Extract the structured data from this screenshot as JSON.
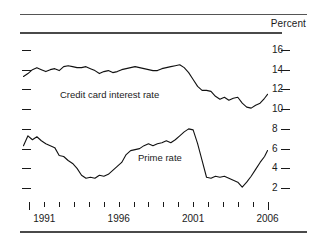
{
  "figure": {
    "unit_label": "Percent"
  },
  "chart_data": {
    "type": "line",
    "title": "",
    "subtitle": "",
    "xlabel": "",
    "ylabel": "Percent",
    "unit_label": "Percent",
    "grid": false,
    "legend": "inline-annotations",
    "xlim": [
      1989.5,
      2006.3
    ],
    "ylim": [
      1.0,
      17.0
    ],
    "yticks": [
      16,
      14,
      12,
      10,
      8,
      6,
      4,
      2
    ],
    "ytick_labels": [
      "16",
      "14",
      "12",
      "10",
      "8",
      "6",
      "4",
      "2"
    ],
    "xticks": [
      1990,
      1991,
      1992,
      1993,
      1994,
      1995,
      1996,
      1997,
      1998,
      1999,
      2000,
      2001,
      2002,
      2003,
      2004,
      2005,
      2006
    ],
    "xtick_labels": [
      "1991",
      "1996",
      "2001",
      "2006"
    ],
    "xtick_labeled_years": [
      1991,
      1996,
      2001,
      2006
    ],
    "series": [
      {
        "name": "Credit card interest rate",
        "label": "Credit card interest rate",
        "color": "#111111",
        "x": [
          1989.6,
          1989.9,
          1990.2,
          1990.5,
          1990.8,
          1991.1,
          1991.4,
          1991.7,
          1992.0,
          1992.3,
          1992.6,
          1992.9,
          1993.2,
          1993.5,
          1993.8,
          1994.1,
          1994.4,
          1994.7,
          1995.0,
          1995.3,
          1995.6,
          1995.9,
          1996.2,
          1996.5,
          1996.8,
          1997.1,
          1997.4,
          1997.7,
          1998.0,
          1998.3,
          1998.6,
          1998.9,
          1999.2,
          1999.5,
          1999.8,
          2000.1,
          2000.4,
          2000.7,
          2001.0,
          2001.3,
          2001.6,
          2001.9,
          2002.2,
          2002.5,
          2002.8,
          2003.1,
          2003.4,
          2003.7,
          2004.0,
          2004.3,
          2004.6,
          2004.9,
          2005.2,
          2005.5,
          2005.8,
          2006.0
        ],
        "values": [
          13.3,
          13.6,
          14.0,
          14.2,
          14.0,
          13.8,
          14.0,
          14.1,
          13.9,
          14.3,
          14.4,
          14.3,
          14.2,
          14.2,
          14.3,
          14.1,
          13.9,
          13.6,
          13.8,
          13.9,
          13.7,
          13.8,
          14.0,
          14.1,
          14.2,
          14.3,
          14.2,
          14.1,
          14.0,
          13.9,
          13.9,
          14.1,
          14.2,
          14.3,
          14.4,
          14.5,
          14.2,
          13.7,
          13.0,
          12.3,
          11.9,
          11.9,
          11.8,
          11.3,
          11.0,
          11.2,
          10.9,
          11.1,
          11.2,
          10.6,
          10.2,
          10.1,
          10.4,
          10.6,
          11.1,
          11.5
        ]
      },
      {
        "name": "Prime rate",
        "label": "Prime rate",
        "color": "#111111",
        "x": [
          1989.6,
          1989.9,
          1990.2,
          1990.5,
          1990.8,
          1991.1,
          1991.4,
          1991.7,
          1992.0,
          1992.3,
          1992.6,
          1992.9,
          1993.2,
          1993.5,
          1993.8,
          1994.1,
          1994.4,
          1994.7,
          1995.0,
          1995.3,
          1995.6,
          1995.9,
          1996.2,
          1996.5,
          1996.8,
          1997.1,
          1997.4,
          1997.7,
          1998.0,
          1998.3,
          1998.6,
          1998.9,
          1999.2,
          1999.5,
          1999.8,
          2000.1,
          2000.4,
          2000.7,
          2001.0,
          2001.3,
          2001.6,
          2001.9,
          2002.2,
          2002.5,
          2002.8,
          2003.1,
          2003.4,
          2003.7,
          2004.0,
          2004.3,
          2004.6,
          2004.9,
          2005.2,
          2005.5,
          2005.8,
          2006.0
        ],
        "values": [
          6.3,
          7.3,
          6.9,
          7.2,
          6.8,
          6.5,
          6.3,
          6.1,
          5.3,
          5.2,
          4.8,
          4.5,
          4.0,
          3.3,
          3.0,
          3.1,
          3.0,
          3.3,
          3.2,
          3.4,
          3.8,
          4.2,
          4.6,
          5.4,
          5.8,
          5.9,
          6.0,
          6.3,
          6.5,
          6.3,
          6.5,
          6.6,
          6.8,
          6.6,
          6.9,
          7.3,
          7.7,
          8.0,
          7.9,
          6.5,
          4.8,
          3.1,
          3.0,
          3.2,
          3.1,
          3.2,
          3.0,
          2.8,
          2.6,
          2.1,
          2.6,
          3.2,
          3.9,
          4.6,
          5.2,
          5.8
        ]
      }
    ]
  }
}
